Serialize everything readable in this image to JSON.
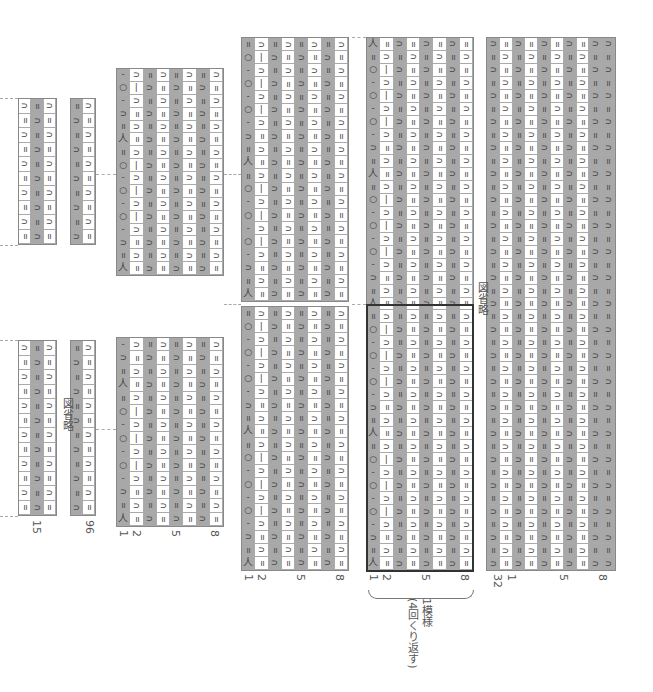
{
  "colors": {
    "gray": "#a8a8a8",
    "white": "#ffffff",
    "grid": "#aaaaaa",
    "outline": "#333333"
  },
  "symbols": {
    "knit": "=",
    "purl": "∩",
    "purl_alt": "∩",
    "yo": "○",
    "bar": "|",
    "dash": "-",
    "k2tog": "人",
    "ssk": "入"
  },
  "panels": [
    {
      "id": "p1",
      "x": 18,
      "cols": 3,
      "colors": [
        "w",
        "g",
        "w"
      ],
      "blocks": [
        {
          "y": 98,
          "h": 147,
          "rows": 10
        },
        {
          "y": 340,
          "h": 176,
          "rows": 12
        }
      ],
      "patterns": [
        "rib3"
      ]
    },
    {
      "id": "p2",
      "x": 70,
      "cols": 2,
      "colors": [
        "g",
        "w"
      ],
      "blocks": [
        {
          "y": 98,
          "h": 147,
          "rows": 10
        },
        {
          "y": 340,
          "h": 176,
          "rows": 12
        }
      ],
      "patterns": [
        "rib2"
      ]
    },
    {
      "id": "p3",
      "x": 116,
      "cols": 8,
      "colors": [
        "g",
        "w",
        "g",
        "w",
        "g",
        "w",
        "g",
        "w"
      ],
      "blocks": [
        {
          "y": 68,
          "h": 208,
          "rows": 16
        },
        {
          "y": 337,
          "h": 190,
          "rows": 14
        }
      ],
      "patterns": [
        "lace"
      ]
    },
    {
      "id": "p4",
      "x": 241,
      "cols": 8,
      "colors": [
        "g",
        "w",
        "g",
        "w",
        "g",
        "w",
        "g",
        "w"
      ],
      "blocks": [
        {
          "y": 37,
          "h": 265,
          "rows": 20
        },
        {
          "y": 306,
          "h": 265,
          "rows": 20
        }
      ],
      "patterns": [
        "lace"
      ]
    },
    {
      "id": "p5",
      "x": 366,
      "cols": 8,
      "colors": [
        "g",
        "w",
        "g",
        "w",
        "g",
        "w",
        "g",
        "w"
      ],
      "blocks": [
        {
          "y": 37,
          "h": 534,
          "rows": 41
        }
      ],
      "patterns": [
        "lace"
      ]
    },
    {
      "id": "p6",
      "x": 486,
      "cols": 10,
      "colors": [
        "g",
        "w",
        "g",
        "w",
        "g",
        "w",
        "g",
        "w",
        "g",
        "g"
      ],
      "blocks": [
        {
          "y": 37,
          "h": 534,
          "rows": 41
        }
      ],
      "patterns": [
        "rib"
      ]
    }
  ],
  "labels": {
    "omitted": "図省略",
    "p1_bottom": "15",
    "p2_bottom": "96",
    "col_numbers": {
      "one": "1",
      "two": "2",
      "five": "5",
      "eight": "8",
      "thirtytwo": "32"
    },
    "repeat_title": "1模様",
    "repeat_note": "(4回くり返す)"
  }
}
